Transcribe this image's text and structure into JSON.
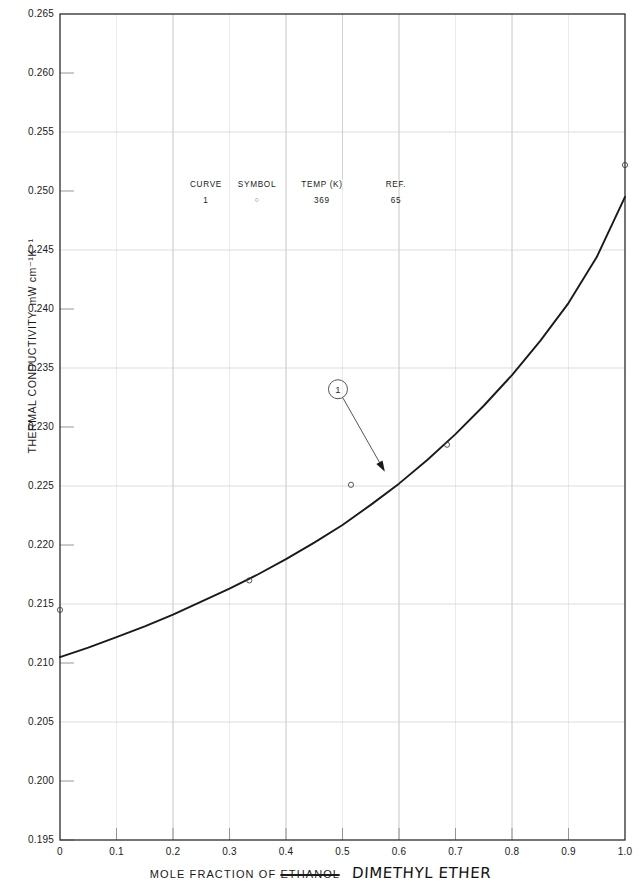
{
  "chart_data": {
    "type": "line",
    "title": "",
    "xlabel_prefix": "MOLE FRACTION OF",
    "xlabel_struck": "ETHANOL",
    "xlabel_handwritten": "DIMETHYL ETHER",
    "ylabel": "THERMAL CONDUCTIVITY, mW cm⁻¹K⁻¹",
    "xlim": [
      0,
      1.0
    ],
    "ylim": [
      0.195,
      0.265
    ],
    "xticks": [
      0,
      0.1,
      0.2,
      0.3,
      0.4,
      0.5,
      0.6,
      0.7,
      0.8,
      0.9,
      1.0
    ],
    "xticklabels": [
      "0",
      "0.1",
      "0.2",
      "0.3",
      "0.4",
      "0.5",
      "0.6",
      "0.7",
      "0.8",
      "0.9",
      "1.0"
    ],
    "yticks": [
      0.195,
      0.2,
      0.205,
      0.21,
      0.215,
      0.22,
      0.225,
      0.23,
      0.235,
      0.24,
      0.245,
      0.25,
      0.255,
      0.26,
      0.265
    ],
    "yticklabels": [
      "0.195",
      "0.200",
      "0.205",
      "0.210",
      "0.215",
      "0.220",
      "0.225",
      "0.230",
      "0.235",
      "0.240",
      "0.245",
      "0.250",
      "0.255",
      "0.260",
      "0.265"
    ],
    "grid": true,
    "grid_x_major": [
      0.2,
      0.4,
      0.6,
      0.8
    ],
    "grid_y_major": [
      0.205,
      0.215,
      0.225,
      0.235,
      0.245,
      0.255,
      0.265
    ],
    "legend_position": "upper-center-inside",
    "series": [
      {
        "name": "Curve 1",
        "curve_label": "1",
        "style": "solid",
        "color": "#1a1a1a",
        "x": [
          0.0,
          0.05,
          0.1,
          0.15,
          0.2,
          0.25,
          0.3,
          0.35,
          0.4,
          0.45,
          0.5,
          0.55,
          0.6,
          0.65,
          0.7,
          0.75,
          0.8,
          0.85,
          0.9,
          0.95,
          1.0
        ],
        "values": [
          0.2105,
          0.2113,
          0.2122,
          0.2131,
          0.2141,
          0.2152,
          0.2163,
          0.2175,
          0.2188,
          0.2202,
          0.2217,
          0.2234,
          0.2252,
          0.2272,
          0.2294,
          0.2318,
          0.2344,
          0.2373,
          0.2405,
          0.2444,
          0.2495
        ]
      }
    ],
    "points": [
      {
        "x": 0.0,
        "y": 0.2145
      },
      {
        "x": 0.335,
        "y": 0.217
      },
      {
        "x": 0.515,
        "y": 0.2251
      },
      {
        "x": 0.685,
        "y": 0.2285
      },
      {
        "x": 1.0,
        "y": 0.2522
      }
    ],
    "annotation": {
      "label": "1",
      "circle_at": {
        "x": 0.492,
        "y": 0.2332
      },
      "arrow_to": {
        "x": 0.575,
        "y": 0.2262
      }
    }
  },
  "legend": {
    "headers": [
      "CURVE",
      "SYMBOL",
      "TEMP (K)",
      "REF."
    ],
    "rows": [
      {
        "curve": "1",
        "symbol": "○",
        "temp": "369",
        "ref": "65"
      }
    ]
  }
}
